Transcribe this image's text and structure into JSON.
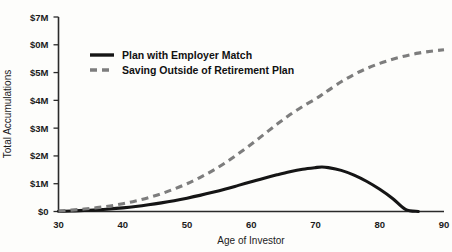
{
  "chart_data": {
    "type": "line",
    "title": "",
    "xlabel": "Age of Investor",
    "ylabel": "Total Accumulations",
    "xlim": [
      30,
      90
    ],
    "ylim": [
      0,
      7
    ],
    "grid": false,
    "legend_position": "upper-left-inside",
    "x_tick_labels": [
      "30",
      "40",
      "50",
      "60",
      "70",
      "80",
      "90"
    ],
    "x_ticks": [
      30,
      40,
      50,
      60,
      70,
      80,
      90
    ],
    "y_tick_labels": [
      "$7M",
      "$0M",
      "$5M",
      "$4M",
      "$3M",
      "$2M",
      "$1M",
      "$0"
    ],
    "y_ticks": [
      7,
      6,
      5,
      4,
      3,
      2,
      1,
      0
    ],
    "x": [
      30,
      32,
      34,
      36,
      38,
      40,
      42,
      44,
      46,
      48,
      50,
      52,
      54,
      56,
      58,
      60,
      62,
      64,
      66,
      68,
      70,
      71,
      72,
      74,
      76,
      78,
      80,
      82,
      84,
      86,
      88,
      90
    ],
    "series": [
      {
        "name": "Plan with Employer Match",
        "style": "solid",
        "color": "#151515",
        "values": [
          0.02,
          0.05,
          0.09,
          0.14,
          0.2,
          0.28,
          0.38,
          0.5,
          0.64,
          0.81,
          1.0,
          1.22,
          1.47,
          1.76,
          2.08,
          2.42,
          2.78,
          3.14,
          3.48,
          3.78,
          4.05,
          4.2,
          4.36,
          4.67,
          4.93,
          5.15,
          5.33,
          5.48,
          5.6,
          5.7,
          5.77,
          5.82
        ]
      },
      {
        "name": "Saving Outside of Retirement Plan",
        "style": "dashed",
        "color": "#7d7d7d",
        "values": [
          0.01,
          0.02,
          0.04,
          0.06,
          0.09,
          0.13,
          0.18,
          0.24,
          0.31,
          0.39,
          0.48,
          0.58,
          0.69,
          0.81,
          0.94,
          1.07,
          1.2,
          1.32,
          1.43,
          1.52,
          1.58,
          1.6,
          1.58,
          1.48,
          1.31,
          1.08,
          0.8,
          0.47,
          0.08,
          0.0,
          0.0,
          0.0
        ]
      }
    ],
    "annotations": {
      "dashed_peak_age": 71,
      "dashed_peak_value": 1.6,
      "dashed_depleted_age": 84,
      "solid_kink_age": 70,
      "solid_kink_value": 4.05,
      "solid_end_value": 5.82
    }
  },
  "legend": {
    "entries": [
      {
        "label": "Plan with Employer Match"
      },
      {
        "label": "Saving Outside of Retirement Plan"
      }
    ]
  }
}
